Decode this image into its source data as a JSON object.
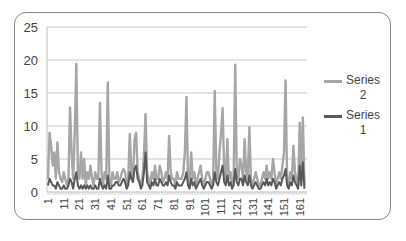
{
  "chart_data": {
    "type": "line",
    "title": "",
    "xlabel": "",
    "ylabel": "",
    "ylim": [
      0,
      25
    ],
    "yticks": [
      0,
      5,
      10,
      15,
      20,
      25
    ],
    "xtick_labels": [
      "1",
      "11",
      "21",
      "31",
      "41",
      "51",
      "61",
      "71",
      "81",
      "91",
      "101",
      "111",
      "121",
      "131",
      "141",
      "151",
      "161"
    ],
    "grid": {
      "horizontal": true,
      "vertical": false
    },
    "legend_position": "right",
    "n_points": 165,
    "series": [
      {
        "name": "Series 2",
        "color": "#a6a6a6",
        "values": [
          2,
          9,
          7,
          4,
          6,
          2,
          7.5,
          3,
          2,
          1.5,
          3,
          2,
          1,
          2,
          12.8,
          6,
          2,
          9,
          19.4,
          3,
          2,
          6,
          2,
          5,
          1,
          3,
          2,
          4,
          2,
          1,
          3,
          2,
          2,
          13.5,
          3,
          1,
          3,
          2,
          16.6,
          2,
          1,
          3,
          2,
          2,
          3,
          1.5,
          2,
          3,
          3.5,
          3,
          1,
          2,
          8.8,
          3,
          2,
          8,
          9,
          3,
          2,
          1,
          2,
          5.5,
          11.8,
          3,
          2,
          1,
          3,
          2,
          4,
          2,
          2,
          4,
          3,
          1.5,
          2,
          3,
          2,
          8.5,
          3,
          2,
          2,
          1,
          3,
          2,
          2,
          2,
          3,
          6,
          14.4,
          2,
          1,
          6,
          2,
          3,
          1,
          2,
          3,
          4,
          2,
          1,
          2,
          3,
          3,
          2,
          1,
          2,
          15.3,
          3,
          2,
          6,
          9,
          12.7,
          3,
          2,
          8,
          2,
          3,
          1,
          2,
          19.3,
          3,
          2,
          5,
          4,
          2,
          8,
          3,
          2,
          9.8,
          2,
          1,
          2,
          3,
          2,
          1,
          1,
          2,
          3,
          2,
          4,
          2,
          3,
          2,
          5,
          3,
          1,
          2,
          3,
          2,
          4,
          6,
          16.9,
          2,
          1,
          3,
          2,
          7,
          3,
          2,
          1,
          10.5,
          2,
          11.3,
          1
        ],
        "note": "values estimated from pixel positions; major peaks ~19.4 (pt 19), ~19.3 (pt 122), ~16.9 (pt 152), ~16.6 (pt 39), ~15.3 (pt 107), ~14.4 (pt 89)"
      },
      {
        "name": "Series 1",
        "color": "#595959",
        "values": [
          1,
          2,
          1.5,
          1,
          1,
          0.5,
          1.5,
          1,
          0.5,
          0.5,
          1,
          0.5,
          0.5,
          1,
          2,
          1.5,
          0.5,
          2,
          3,
          1,
          0.5,
          1,
          0.5,
          1,
          0.5,
          1,
          0.5,
          1,
          0.5,
          0.5,
          1,
          0.5,
          0.5,
          2,
          1,
          0.5,
          1,
          0.5,
          2.5,
          0.5,
          0.5,
          1,
          1,
          1.5,
          1.5,
          1,
          1,
          1.5,
          2,
          1.5,
          0.5,
          1,
          3,
          2,
          1.5,
          3.5,
          4,
          2,
          1.5,
          0.5,
          1,
          3,
          6,
          1.5,
          1,
          0.5,
          1.5,
          1,
          2,
          1,
          1,
          2,
          1.5,
          1,
          1,
          1.5,
          1,
          2.5,
          1.5,
          1,
          1,
          0.5,
          1.5,
          1,
          1,
          1,
          1.5,
          2,
          3,
          1,
          0.5,
          2,
          1,
          1.5,
          0.5,
          1,
          1.5,
          2,
          1,
          0.5,
          1,
          1.5,
          1.5,
          1,
          0.5,
          1,
          3,
          1.5,
          1,
          2,
          3,
          4,
          1.5,
          1,
          2.5,
          1,
          1.5,
          0.5,
          1,
          3.5,
          1.5,
          1,
          2,
          2,
          1,
          2.5,
          1.5,
          1,
          2.5,
          1,
          0.5,
          1,
          1.5,
          1,
          0.5,
          0.5,
          1,
          1.5,
          1,
          2,
          1,
          1.5,
          1,
          2,
          1.5,
          0.5,
          1,
          1.5,
          1,
          2,
          2.5,
          3.5,
          1,
          0.5,
          1.5,
          1,
          2.5,
          1.5,
          1,
          0.5,
          4,
          1,
          4.5,
          0.5
        ]
      }
    ]
  },
  "legend": {
    "items": [
      {
        "label_line1": "Series",
        "label_line2": "2",
        "color": "#a6a6a6"
      },
      {
        "label_line1": "Series",
        "label_line2": "1",
        "color": "#595959"
      }
    ]
  }
}
